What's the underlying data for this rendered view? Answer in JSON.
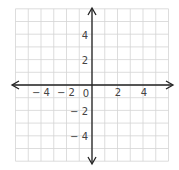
{
  "diagram": {
    "type": "coordinate-plane",
    "origin_px": [
      92,
      85
    ],
    "unit_px": [
      12.75,
      12.7
    ],
    "grid_range": {
      "x": [
        -6,
        6
      ],
      "y": [
        -6,
        6
      ]
    },
    "colors": {
      "grid": "#d4d4d4",
      "axis": "#222222",
      "label": "#444444",
      "background": "#ffffff"
    },
    "x_axis": {
      "ticks": [
        {
          "value": -4,
          "label": "− 4"
        },
        {
          "value": -2,
          "label": "− 2"
        },
        {
          "value": 0,
          "label": "0"
        },
        {
          "value": 2,
          "label": "2"
        },
        {
          "value": 4,
          "label": "4"
        }
      ]
    },
    "y_axis": {
      "ticks": [
        {
          "value": 4,
          "label": "4"
        },
        {
          "value": 2,
          "label": "2"
        },
        {
          "value": -2,
          "label": "− 2"
        },
        {
          "value": -4,
          "label": "− 4"
        }
      ]
    }
  }
}
